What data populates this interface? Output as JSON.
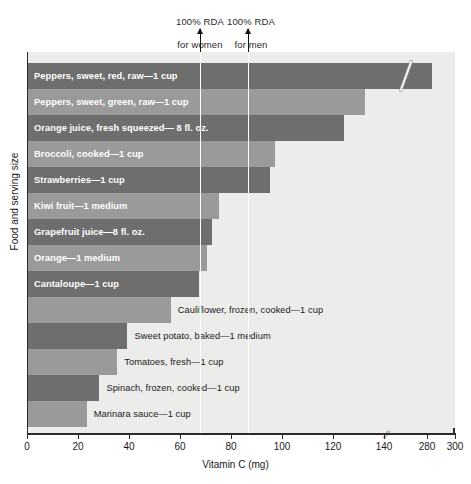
{
  "chart_data": {
    "type": "bar",
    "orientation": "horizontal",
    "title": "",
    "xlabel": "Vitamin C (mg)",
    "ylabel": "Food and serving size",
    "xlim": [
      0,
      300
    ],
    "xticks": [
      0,
      20,
      40,
      60,
      80,
      100,
      120,
      140,
      280,
      300
    ],
    "xtick_labels": [
      "0",
      "20",
      "40",
      "60",
      "80",
      "100",
      "120",
      "140",
      "280",
      "300"
    ],
    "axis_break": {
      "between": [
        140,
        280
      ],
      "marker": "//"
    },
    "grid": false,
    "legend": null,
    "categories": [
      "Peppers, sweet, red, raw—1 cup",
      "Peppers, sweet, green, raw—1 cup",
      "Orange juice, fresh squeezed— 8 fl. oz.",
      "Broccoli, cooked—1 cup",
      "Strawberries—1 cup",
      "Kiwi fruit—1 medium",
      "Grapefruit juice—8 fl. oz.",
      "Orange—1 medium",
      "Cantaloupe—1 cup",
      "Cauliflower, frozen, cooked—1 cup",
      "Sweet potato, baked—1 medium",
      "Tomatoes, fresh—1 cup",
      "Spinach, frozen, cooked—1 cup",
      "Marinara sauce—1 cup"
    ],
    "values": [
      283,
      132,
      124,
      97,
      95,
      75,
      72,
      70,
      67,
      56,
      39,
      35,
      28,
      23
    ],
    "annotations": [
      {
        "label": "100% RDA\nfor women",
        "value": 60
      },
      {
        "label": "100% RDA\nfor men",
        "value": 90
      }
    ],
    "colors": {
      "bar_dark": "#6e6e6e",
      "bar_light": "#9a9a9a",
      "plot_background": "#ececeb",
      "reference_line": "#fdfdfd",
      "axis": "#2b2b2b",
      "label_inside": "#ffffff",
      "label_outside": "#1a1a1a"
    }
  },
  "annotations": {
    "women": {
      "line1": "100% RDA",
      "line2": "for women"
    },
    "men": {
      "line1": "100% RDA",
      "line2": "for men"
    }
  },
  "axis": {
    "xlabel": "Vitamin C (mg)",
    "ylabel": "Food and serving size",
    "break_mark": "//"
  }
}
